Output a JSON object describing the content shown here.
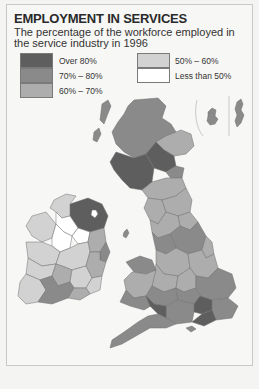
{
  "title": "EMPLOYMENT IN SERVICES",
  "subtitle": "The percentage of the workforce employed in the service industry in 1996",
  "legend": {
    "items": [
      {
        "label": "Over 80%",
        "color": "#5e5e5e"
      },
      {
        "label": "70% – 80%",
        "color": "#8a8a8a"
      },
      {
        "label": "60% – 70%",
        "color": "#adadad"
      },
      {
        "label": "50% – 60%",
        "color": "#d2d2d2"
      },
      {
        "label": "Less than 50%",
        "color": "#ffffff"
      }
    ]
  },
  "map": {
    "colors": {
      "over80": "#5e5e5e",
      "c70_80": "#8a8a8a",
      "c60_70": "#adadad",
      "c50_60": "#d2d2d2",
      "under50": "#ffffff",
      "border": "#6f6f6f",
      "sea": "#f7f7f5"
    }
  }
}
